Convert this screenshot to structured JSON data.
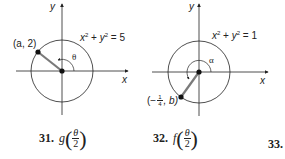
{
  "figures": [
    {
      "id": "left",
      "equation": {
        "x_term": "x",
        "y_term": "y",
        "exp": "2",
        "rhs": "5"
      },
      "point_label": "(a, 2)",
      "angle_label": "θ",
      "axis_x": "x",
      "axis_y": "y"
    },
    {
      "id": "right",
      "equation": {
        "x_term": "x",
        "y_term": "y",
        "exp": "2",
        "rhs": "1"
      },
      "point_label_prefix": "(−",
      "point_frac_num": "1",
      "point_frac_den": "4",
      "point_label_suffix": ", b)",
      "angle_label": "α",
      "axis_x": "x",
      "axis_y": "y"
    }
  ],
  "exercises": [
    {
      "number": "31.",
      "func": "g",
      "arg_num": "θ",
      "arg_den": "2"
    },
    {
      "number": "32.",
      "func": "f",
      "arg_num": "θ",
      "arg_den": "2"
    },
    {
      "number": "33.",
      "func": "",
      "arg_num": "",
      "arg_den": ""
    }
  ],
  "colors": {
    "line": "#222222",
    "segment": "#7a7a7a",
    "text": "#222222"
  }
}
